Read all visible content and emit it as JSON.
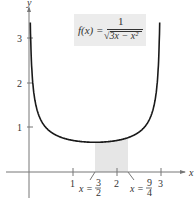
{
  "chart_data": {
    "type": "line",
    "title": "",
    "function_label": {
      "lhs": "f(x) =",
      "numerator": "1",
      "denominator": "√3x − x²"
    },
    "xlabel": "x",
    "ylabel": "y",
    "xlim": [
      -0.6,
      3.6
    ],
    "ylim": [
      -0.5,
      3.6
    ],
    "x_ticks": [
      1,
      2,
      3
    ],
    "x_tick_labels": [
      "1",
      "2",
      "3"
    ],
    "y_ticks": [
      1,
      2,
      3
    ],
    "y_tick_labels": [
      "1",
      "2",
      "3"
    ],
    "grid": false,
    "series": [
      {
        "name": "f(x) = 1/sqrt(3x - x^2)",
        "x": [
          0.03,
          0.05,
          0.08,
          0.12,
          0.2,
          0.3,
          0.5,
          0.75,
          1.0,
          1.25,
          1.5,
          1.75,
          2.0,
          2.25,
          2.5,
          2.7,
          2.8,
          2.88,
          2.92,
          2.95,
          2.97
        ],
        "y": [
          3.33,
          2.6,
          2.06,
          1.68,
          1.33,
          1.11,
          0.89,
          0.77,
          0.71,
          0.67,
          0.67,
          0.67,
          0.71,
          0.77,
          0.89,
          1.11,
          1.29,
          1.68,
          2.06,
          2.6,
          3.33
        ]
      }
    ],
    "shaded_region": {
      "x_start": 1.5,
      "x_end": 2.25,
      "label_start": "x = 3/2",
      "label_end": "x = 9/4"
    },
    "annotations": [
      {
        "text": "x = 3/2",
        "x": 1.5
      },
      {
        "text": "x = 9/4",
        "x": 2.25
      }
    ]
  },
  "axes": {
    "x_label": "x",
    "y_label": "y",
    "x_ticks": [
      "1",
      "2",
      "3"
    ],
    "y_ticks": [
      "1",
      "2",
      "3"
    ]
  },
  "annotations": {
    "start_lhs": "x =",
    "start_num": "3",
    "start_den": "2",
    "end_lhs": "x =",
    "end_num": "9",
    "end_den": "4"
  },
  "formula": {
    "lhs": "f(x) =",
    "numerator": "1",
    "denominator": "3x − x²",
    "radical": "√"
  },
  "colors": {
    "curve": "#1a1a1a",
    "axis": "#555555",
    "shade": "#e6e6e6",
    "formula_bg": "#ececec"
  }
}
